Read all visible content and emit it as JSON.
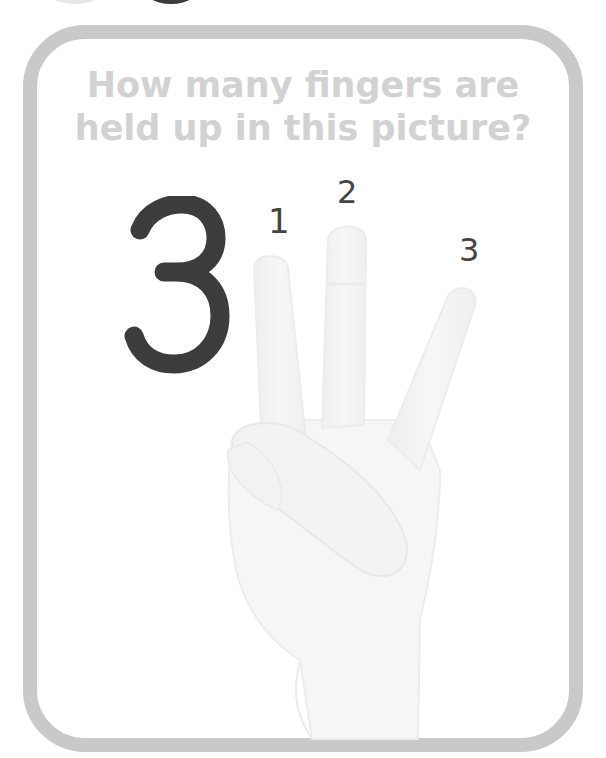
{
  "card": {
    "question_line1": "How many fingers are",
    "question_line2": "held up in this picture?",
    "answer_numeral": "3",
    "finger_labels": [
      "1",
      "2",
      "3"
    ]
  },
  "colors": {
    "border": "#c9c9c9",
    "title_text": "#d2d2d2",
    "numeral": "#3c3c3c",
    "labels": "#454545",
    "hand": "#f4f4f4"
  },
  "illustration": {
    "subject": "hand holding up three fingers (index, middle, ring), thumb folded over little finger"
  }
}
